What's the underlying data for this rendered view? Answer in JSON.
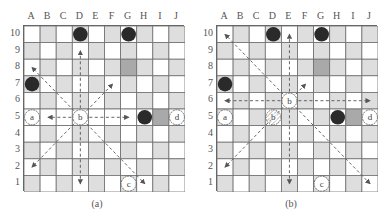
{
  "figure": {
    "columns": [
      "A",
      "B",
      "C",
      "D",
      "E",
      "F",
      "G",
      "H",
      "I",
      "J"
    ],
    "rows": [
      "10",
      "9",
      "8",
      "7",
      "6",
      "5",
      "4",
      "3",
      "2",
      "1"
    ],
    "colors": {
      "light_square": "#ffffff",
      "dark_square": "#dedede",
      "highlight_square": "#a9a9a9",
      "grid_line": "#6e6e6e",
      "black_piece": "#2a2a2a",
      "arrow": "#555555"
    },
    "panels": [
      {
        "caption": "(a)",
        "black_pieces": [
          "D10",
          "G10",
          "A7",
          "H5"
        ],
        "highlight_squares": [
          "G8",
          "I5"
        ],
        "white_rows": [
          "5"
        ],
        "labeled_pieces": [
          {
            "label": "a",
            "square": "A5",
            "style": "solid"
          },
          {
            "label": "b",
            "square": "D5",
            "style": "solid"
          },
          {
            "label": "c",
            "square": "G1",
            "style": "solid"
          },
          {
            "label": "d",
            "square": "J5",
            "style": "solid"
          }
        ],
        "moves_from": "D5",
        "arrow_targets": [
          "D9",
          "D1",
          "B5",
          "G5",
          "A8",
          "F7",
          "A2",
          "H1"
        ]
      },
      {
        "caption": "(b)",
        "black_pieces": [
          "D10",
          "G10",
          "A7",
          "H5"
        ],
        "highlight_squares": [
          "G8",
          "I5"
        ],
        "white_rows": [],
        "labeled_pieces": [
          {
            "label": "a",
            "square": "A5",
            "style": "solid"
          },
          {
            "label": "b",
            "square": "E6",
            "style": "solid"
          },
          {
            "label": "b",
            "square": "D5",
            "style": "hatched"
          },
          {
            "label": "c",
            "square": "G1",
            "style": "solid"
          },
          {
            "label": "d",
            "square": "J5",
            "style": "solid"
          }
        ],
        "moves_from": "E6",
        "arrow_targets": [
          "E10",
          "E1",
          "A6",
          "J6",
          "A10",
          "F7",
          "A2",
          "J1"
        ]
      }
    ]
  }
}
